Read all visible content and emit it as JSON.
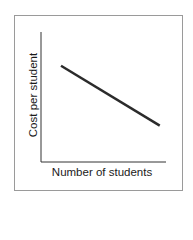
{
  "chart_data": {
    "type": "line",
    "title": "",
    "xlabel": "Number of students",
    "ylabel": "Cost per student",
    "x_ticks": [],
    "y_ticks": [],
    "grid": false,
    "legend": null,
    "series": [
      {
        "name": "Cost per student",
        "description": "Straight line sloping downward: cost per student decreases as number of students increases",
        "x": [
          0.16,
          0.95
        ],
        "y": [
          0.74,
          0.28
        ]
      }
    ],
    "xlim": [
      0,
      1
    ],
    "ylim": [
      0,
      1
    ],
    "colors": {
      "line": "#2b2b2b",
      "axes": "#333333",
      "frame": "#9a9a9a"
    }
  }
}
